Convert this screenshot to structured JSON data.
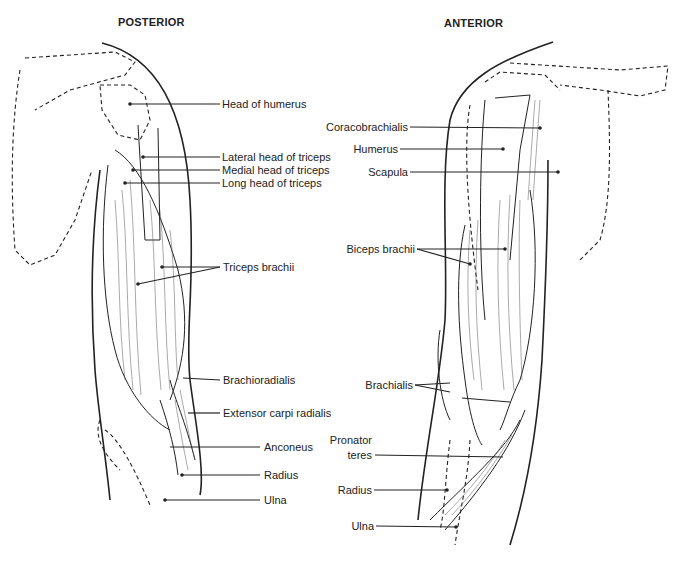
{
  "views": {
    "posterior": {
      "title": "POSTERIOR",
      "labels": [
        "Head of humerus",
        "Lateral head of triceps",
        "Medial head of triceps",
        "Long head of triceps",
        "Triceps brachii",
        "Brachioradialis",
        "Extensor carpi radialis",
        "Anconeus",
        "Radius",
        "Ulna"
      ]
    },
    "anterior": {
      "title": "ANTERIOR",
      "labels": [
        "Coracobrachialis",
        "Humerus",
        "Scapula",
        "Biceps brachii",
        "Brachialis",
        "Pronator",
        "teres",
        "Radius",
        "Ulna"
      ]
    }
  },
  "colors": {
    "ink": "#222222",
    "background": "#ffffff"
  }
}
